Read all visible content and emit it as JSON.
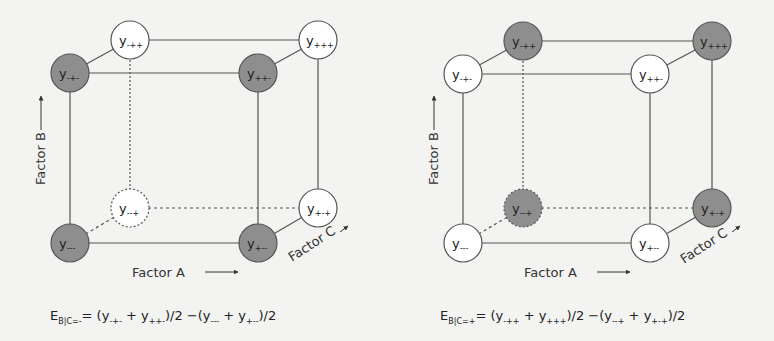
{
  "colors": {
    "background": "#f3f3f1",
    "line": "#555555",
    "shaded_node": "#8e8e8e",
    "open_node": "#ffffff"
  },
  "axes": {
    "factor_a": "Factor A",
    "factor_b": "Factor B",
    "factor_c": "Factor C"
  },
  "panels": [
    {
      "id": "c-minus",
      "nodes": [
        {
          "label": "y",
          "sub": "-++",
          "shaded": false,
          "dashed": false
        },
        {
          "label": "y",
          "sub": "+++",
          "shaded": false,
          "dashed": false
        },
        {
          "label": "y",
          "sub": "-+-",
          "shaded": true,
          "dashed": false
        },
        {
          "label": "y",
          "sub": "++-",
          "shaded": true,
          "dashed": false
        },
        {
          "label": "y",
          "sub": "--+",
          "shaded": false,
          "dashed": true
        },
        {
          "label": "y",
          "sub": "+-+",
          "shaded": false,
          "dashed": false
        },
        {
          "label": "y",
          "sub": "---",
          "shaded": true,
          "dashed": false
        },
        {
          "label": "y",
          "sub": "+--",
          "shaded": true,
          "dashed": false
        }
      ],
      "formula": {
        "lhs": "E",
        "lhs_sub": "B|C=-",
        "eq": "= (y",
        "t1": "-+-",
        "p1": " + y",
        "t2": "++-",
        "mid": ")/2 −(y",
        "t3": "---",
        "p2": " + y",
        "t4": "+--",
        "end": ")/2"
      }
    },
    {
      "id": "c-plus",
      "nodes": [
        {
          "label": "y",
          "sub": "-++",
          "shaded": true,
          "dashed": false
        },
        {
          "label": "y",
          "sub": "+++",
          "shaded": true,
          "dashed": false
        },
        {
          "label": "y",
          "sub": "-+-",
          "shaded": false,
          "dashed": false
        },
        {
          "label": "y",
          "sub": "++-",
          "shaded": false,
          "dashed": false
        },
        {
          "label": "y",
          "sub": "--+",
          "shaded": true,
          "dashed": true
        },
        {
          "label": "y",
          "sub": "+-+",
          "shaded": true,
          "dashed": false
        },
        {
          "label": "y",
          "sub": "---",
          "shaded": false,
          "dashed": false
        },
        {
          "label": "y",
          "sub": "+--",
          "shaded": false,
          "dashed": false
        }
      ],
      "formula": {
        "lhs": "E",
        "lhs_sub": "B|C=+",
        "eq": "= (y",
        "t1": "-++",
        "p1": " + y",
        "t2": "+++",
        "mid": ")/2 −(y",
        "t3": "--+",
        "p2": " + y",
        "t4": "+-+",
        "end": ")/2"
      }
    }
  ]
}
